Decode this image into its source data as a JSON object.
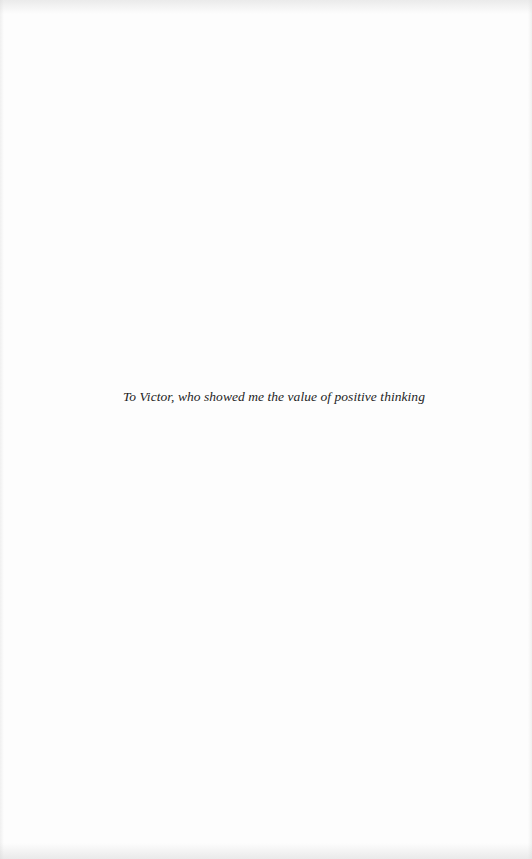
{
  "page": {
    "type": "dedication",
    "background_color": "#fdfdfd",
    "text_color": "#1e1e1e"
  },
  "dedication": {
    "text": "To Victor, who showed me the value of positive thinking"
  }
}
